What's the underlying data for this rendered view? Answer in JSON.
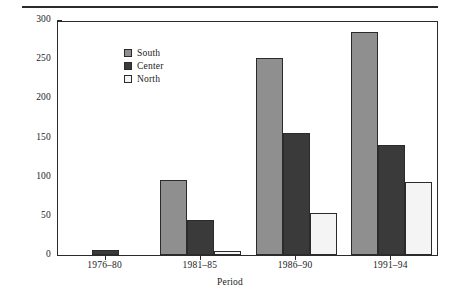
{
  "chart_data": {
    "type": "bar",
    "title": "",
    "xlabel": "Period",
    "ylabel": "Number of incidents",
    "categories": [
      "1976–80",
      "1981–85",
      "1986–90",
      "1991–94"
    ],
    "series": [
      {
        "name": "South",
        "color": "#8f8f8f",
        "values": [
          0,
          96,
          251,
          285
        ]
      },
      {
        "name": "Center",
        "color": "#3a3a3a",
        "values": [
          7,
          45,
          156,
          140
        ]
      },
      {
        "name": "North",
        "color": "#f4f4f4",
        "values": [
          0,
          5,
          54,
          93
        ]
      }
    ],
    "ylim": [
      0,
      300
    ],
    "yticks": [
      0,
      50,
      100,
      150,
      200,
      250,
      300
    ],
    "ytick_labels": [
      "0",
      "50",
      "100",
      "150",
      "200",
      "250",
      "300"
    ],
    "grid": false,
    "legend_position": "upper-left-inside"
  }
}
